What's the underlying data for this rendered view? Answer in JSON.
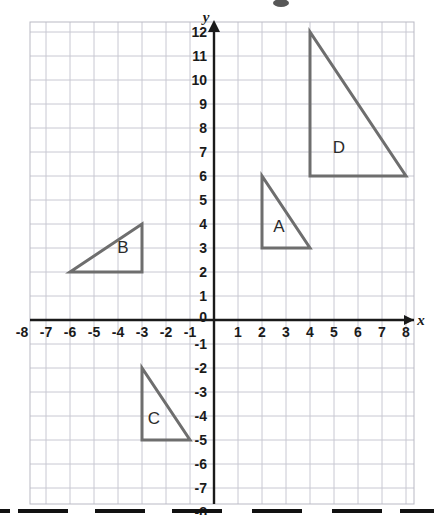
{
  "figure": {
    "axis_labels": {
      "x": "x",
      "y": "y"
    },
    "x_ticks": [
      "-8",
      "-7",
      "-6",
      "-5",
      "-4",
      "-3",
      "-2",
      "-1",
      "1",
      "2",
      "3",
      "4",
      "5",
      "6",
      "7",
      "8"
    ],
    "y_ticks": [
      "12",
      "11",
      "10",
      "9",
      "8",
      "7",
      "6",
      "5",
      "4",
      "3",
      "2",
      "1",
      "-1",
      "-2",
      "-3",
      "-4",
      "-5",
      "-6",
      "-7",
      "-8"
    ],
    "origin_label": "0",
    "shape_labels": [
      "A",
      "B",
      "C",
      "D"
    ],
    "colors": {
      "grid": "#c8c8d2",
      "axis": "#1a1a1a",
      "shape_stroke": "#6e6e6e",
      "label_text": "#2b2b2b",
      "background": "#ffffff"
    }
  },
  "chart_data": {
    "type": "scatter",
    "xlabel": "x",
    "ylabel": "y",
    "xlim": [
      -8,
      8
    ],
    "ylim": [
      -8,
      12
    ],
    "x_ticks": [
      -8,
      -7,
      -6,
      -5,
      -4,
      -3,
      -2,
      -1,
      0,
      1,
      2,
      3,
      4,
      5,
      6,
      7,
      8
    ],
    "y_ticks": [
      -8,
      -7,
      -6,
      -5,
      -4,
      -3,
      -2,
      -1,
      0,
      1,
      2,
      3,
      4,
      5,
      6,
      7,
      8,
      9,
      10,
      11,
      12
    ],
    "grid": true,
    "legend": "none",
    "series": [
      {
        "name": "A",
        "label": "A",
        "label_position": [
          2.7,
          3.9
        ],
        "vertices": [
          [
            2,
            6
          ],
          [
            2,
            3
          ],
          [
            4,
            3
          ]
        ]
      },
      {
        "name": "B",
        "label": "B",
        "label_position": [
          -3.8,
          3.05
        ],
        "vertices": [
          [
            -6,
            2
          ],
          [
            -3,
            2
          ],
          [
            -3,
            4
          ]
        ]
      },
      {
        "name": "C",
        "label": "C",
        "label_position": [
          -2.5,
          -4.1
        ],
        "vertices": [
          [
            -3,
            -2
          ],
          [
            -3,
            -5
          ],
          [
            -1,
            -5
          ]
        ]
      },
      {
        "name": "D",
        "label": "D",
        "label_position": [
          5.2,
          7.2
        ],
        "vertices": [
          [
            4,
            12
          ],
          [
            4,
            6
          ],
          [
            8,
            6
          ]
        ]
      }
    ]
  }
}
